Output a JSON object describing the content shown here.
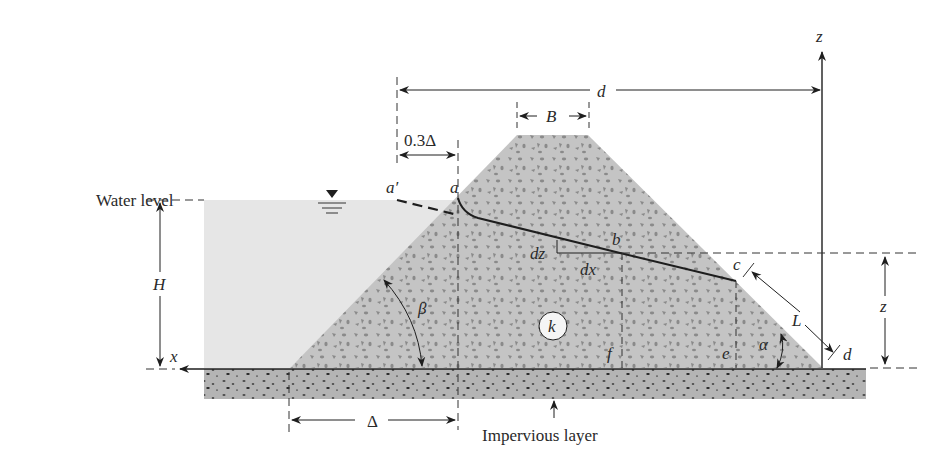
{
  "figure": {
    "labels": {
      "water_level": "Water level",
      "impervious_layer": "Impervious layer",
      "H": "H",
      "B": "B",
      "d_top": "d",
      "d_point": "d",
      "z_axis": "z",
      "z_dim": "z",
      "x_axis": "x",
      "offset": "0.3Δ",
      "delta": "Δ",
      "a_prime": "a′",
      "a": "a",
      "b": "b",
      "c": "c",
      "e": "e",
      "f": "f",
      "k": "k",
      "L": "L",
      "dz": "dz",
      "dx": "dx",
      "alpha": "α",
      "beta": "β"
    },
    "colors": {
      "water": "#e6e6e6",
      "dam": "#c4c4c4",
      "dam_grains": "#8a8a8a",
      "impervious": "#b4b4b4",
      "line": "#1e1e1e"
    }
  }
}
